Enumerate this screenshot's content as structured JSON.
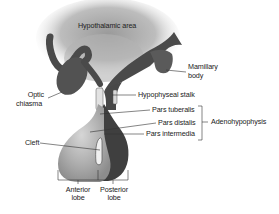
{
  "diagram": {
    "type": "anatomical illustration",
    "colors": {
      "background": "#ffffff",
      "hypothalamic_area": "#b8b8b8",
      "neural_tissue": "#4a4a4a",
      "anterior_lobe": "#a8a8a8",
      "label_text": "#222222",
      "leader_line": "#333333"
    },
    "labels": {
      "hypothalamic_area": "Hypothalamic area",
      "mamillary_body_line1": "Mamillary",
      "mamillary_body_line2": "body",
      "optic_chiasma_line1": "Optic",
      "optic_chiasma_line2": "chiasma",
      "hypophyseal_stalk": "Hypophyseal stalk",
      "pars_tuberalis": "Pars tuberalis",
      "pars_distalis": "Pars distalis",
      "pars_intermedia": "Pars intermedia",
      "adenohypophysis": "Adenohypophysis",
      "cleft": "Cleft",
      "anterior_lobe_line1": "Anterior",
      "anterior_lobe_line2": "lobe",
      "posterior_lobe_line1": "Posterior",
      "posterior_lobe_line2": "lobe"
    },
    "groupings": [
      {
        "bracket": "adenohypophysis",
        "members": [
          "pars_tuberalis",
          "pars_distalis",
          "pars_intermedia"
        ]
      }
    ]
  }
}
